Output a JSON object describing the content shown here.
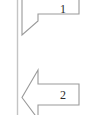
{
  "canvas": {
    "width": 94,
    "height": 115,
    "background": "#ffffff"
  },
  "colors": {
    "outline": "#9a9a9a",
    "fill": "#ffffff",
    "rule": "#c4c4c4",
    "label_text": "#2b2b2b"
  },
  "divider": {
    "name": "vertical-rule",
    "x": 17,
    "y_top": 0,
    "y_bottom": 115,
    "stroke_width": 1.4,
    "color": "#c4c4c4"
  },
  "callouts": [
    {
      "id": "callout-1",
      "label": "1",
      "direction": "left",
      "clipped_top": true,
      "tip_x": 22,
      "tip_y": 35,
      "body_right_x": 79,
      "body_bottom_y": 14,
      "head_join_x": 38
    },
    {
      "id": "callout-2",
      "label": "2",
      "direction": "left",
      "clipped_bottom": true,
      "tip_x": 22,
      "tip_y": 97,
      "body_right_x": 79,
      "body_top_y": 84,
      "body_bottom_y": 105,
      "head_top_y": 70,
      "head_join_x": 38
    }
  ],
  "shapes": {
    "arrow_1_path": "M 79 -12 L 79 14 L 38 14 L 38 21 L 22 35 L 22 -12 Z",
    "arrow_2_path": "M 38 70 L 38 84 L 79 84 L 79 105 L 38 105 L 38 119 L 22 97.5 Z",
    "rule_path": "M 17.5 0 L 17.5 115"
  }
}
